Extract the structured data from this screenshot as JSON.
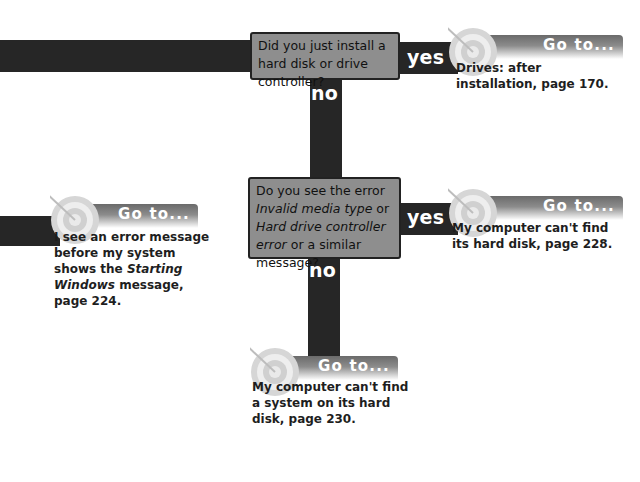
{
  "questions": [
    {
      "id": "q1",
      "text_parts": [
        {
          "text": "Did you just install a hard disk or drive controller?",
          "italic": false
        }
      ]
    },
    {
      "id": "q2",
      "text_parts": [
        {
          "text": "Do you see the error ",
          "italic": false
        },
        {
          "text": "Invalid media type",
          "italic": true
        },
        {
          "text": " or ",
          "italic": false
        },
        {
          "text": "Hard drive controller error",
          "italic": true
        },
        {
          "text": " or a similar message?",
          "italic": false
        }
      ]
    }
  ],
  "labels": {
    "yes": "yes",
    "no": "no"
  },
  "goto_label": "Go to...",
  "destinations": [
    {
      "id": "d1",
      "lines": [
        "Drives: after",
        "installation, page 170."
      ]
    },
    {
      "id": "d2",
      "lines": [
        "My computer can't find",
        "its hard disk, page 228."
      ]
    },
    {
      "id": "d3",
      "lines": [
        "I see an error message",
        "before my system",
        "shows the Starting",
        "Windows message,",
        "page 224."
      ],
      "italic_words": [
        "Starting",
        "Windows"
      ]
    },
    {
      "id": "d4",
      "lines": [
        "My computer can't find",
        "a system on its hard",
        "disk, page 230."
      ]
    }
  ],
  "colors": {
    "connector": "#262626",
    "question_box": "#8e8e8e",
    "banner_dark": "#6a6a6a"
  }
}
